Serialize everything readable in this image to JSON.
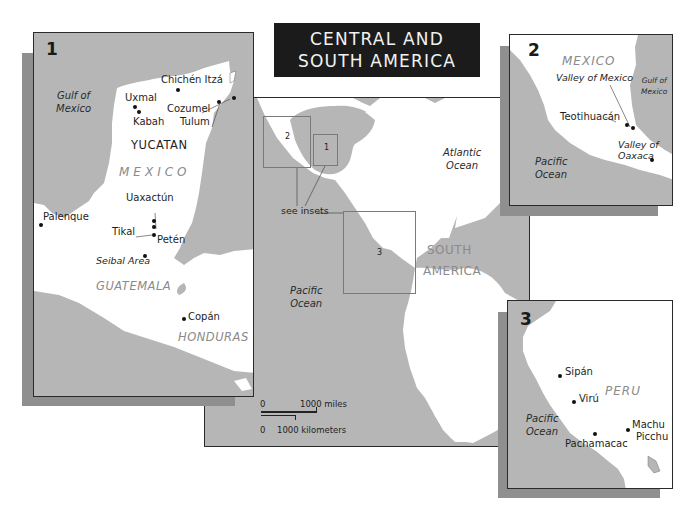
{
  "title": {
    "line1": "CENTRAL AND",
    "line2": "SOUTH AMERICA"
  },
  "colors": {
    "ocean": "#b6b6b6",
    "land": "#ffffff",
    "shadow": "#8f8f8f",
    "title_bg": "#1b1b1b",
    "country_label": "#8a8a8a"
  },
  "main_map": {
    "oceans": {
      "atlantic_1": "Atlantic",
      "atlantic_2": "Ocean",
      "pacific_1": "Pacific",
      "pacific_2": "Ocean"
    },
    "regions": {
      "south_1": "SOUTH",
      "south_2": "AMERICA"
    },
    "inset_markers": {
      "one": "1",
      "two": "2",
      "three": "3"
    },
    "see_insets": "see insets",
    "scale": {
      "miles_zero": "0",
      "miles_label": "1000 miles",
      "km_zero": "0",
      "km_label": "1000 kilometers"
    }
  },
  "inset1": {
    "number": "1",
    "oceans": {
      "gulf_1": "Gulf of",
      "gulf_2": "Mexico"
    },
    "regions": {
      "yucatan": "YUCATAN",
      "mexico": "MEXICO",
      "guatemala": "GUATEMALA",
      "honduras": "HONDURAS"
    },
    "sites": {
      "chichen": "Chichén Itzá",
      "uxmal": "Uxmal",
      "kabah": "Kabah",
      "cozumel": "Cozumel",
      "tulum": "Tulum",
      "uaxactun": "Uaxactún",
      "palenque": "Palenque",
      "tikal": "Tikal",
      "peten": "Petén",
      "seibal": "Seibal Area",
      "copan": "Copán"
    }
  },
  "inset2": {
    "number": "2",
    "regions": {
      "mexico": "MEXICO"
    },
    "oceans": {
      "gulf_1": "Gulf of",
      "gulf_2": "Mexico",
      "pacific_1": "Pacific",
      "pacific_2": "Ocean"
    },
    "sites": {
      "valley_mexico": "Valley of  Mexico",
      "teotihuacan": "Teotihuacán",
      "oaxaca_1": "Valley of",
      "oaxaca_2": "Oaxaca"
    }
  },
  "inset3": {
    "number": "3",
    "regions": {
      "peru": "PERU"
    },
    "oceans": {
      "pacific_1": "Pacific",
      "pacific_2": "Ocean"
    },
    "sites": {
      "sipan": "Sipán",
      "viru": "Virú",
      "pachamacac": "Pachamacac",
      "machu_1": "Machu",
      "machu_2": "Picchu"
    }
  }
}
